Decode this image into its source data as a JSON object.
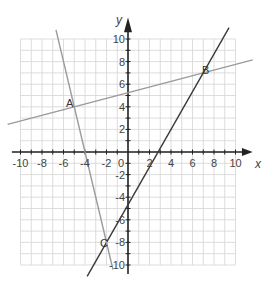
{
  "chart_data": {
    "type": "line",
    "title": "",
    "xlabel": "x",
    "ylabel": "y",
    "xlim": [
      -10,
      10
    ],
    "ylim": [
      -10,
      10
    ],
    "grid": true,
    "x_ticks": [
      -10,
      -8,
      -6,
      -4,
      -2,
      0,
      2,
      4,
      6,
      8,
      10
    ],
    "y_ticks": [
      -10,
      -8,
      -6,
      -4,
      -2,
      2,
      4,
      6,
      8,
      10
    ],
    "x_tick_labels": [
      "-10",
      "-8",
      "-6",
      "-4",
      "-2",
      "0",
      "2",
      "4",
      "6",
      "8",
      "10"
    ],
    "y_tick_labels": [
      "10",
      "8",
      "6",
      "4",
      "2",
      "-2",
      "-4",
      "-6",
      "-8",
      "-10"
    ],
    "series": [
      {
        "name": "line AB",
        "color": "#9a9a9a",
        "equation": "y = 0.25x + 5.25",
        "points": [
          [
            -11.2,
            2.45
          ],
          [
            11.6,
            8.15
          ]
        ]
      },
      {
        "name": "line BC",
        "color": "#3a3a3a",
        "equation": "y = (5/3)x - 14/3",
        "points": [
          [
            -3.8,
            -11
          ],
          [
            9.4,
            11
          ]
        ]
      },
      {
        "name": "line AC",
        "color": "#9a9a9a",
        "equation": "y = -4x - 16",
        "points": [
          [
            -6.7,
            10.8
          ],
          [
            -1.4,
            -10.4
          ]
        ]
      }
    ],
    "annotations": [
      {
        "label": "A",
        "x": -5,
        "y": 4
      },
      {
        "label": "B",
        "x": 7,
        "y": 7
      },
      {
        "label": "C",
        "x": -2,
        "y": -8
      }
    ]
  },
  "labels": {
    "x_axis": "x",
    "y_axis": "y",
    "origin": "0",
    "point_a": "A",
    "point_b": "B",
    "point_c": "C"
  }
}
